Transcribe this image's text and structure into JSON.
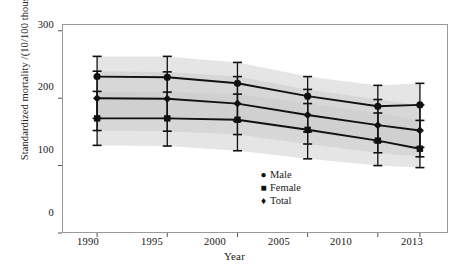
{
  "chart_data": {
    "type": "line",
    "title": "",
    "xlabel": "Year",
    "ylabel": "Standardized mortality /(10/100 thousands)",
    "categories": [
      "1990",
      "1995",
      "2000",
      "2005",
      "2010",
      "2013"
    ],
    "x": [
      1990,
      1995,
      2000,
      2005,
      2010,
      2013
    ],
    "xlim": [
      1987.5,
      2015.0
    ],
    "ylim": [
      0,
      310
    ],
    "yticks": [
      0,
      100,
      200,
      300
    ],
    "xticks": [
      "1990",
      "1995",
      "2000",
      "2005",
      "2010",
      "2013"
    ],
    "grid": false,
    "legend_position": "inside-bottom-center",
    "band_color": "#c9c9c9",
    "band_label": "95% interval band",
    "line_color": "#111111",
    "series": [
      {
        "name": "Male",
        "marker": "circle",
        "values": [
          232,
          231,
          222,
          203,
          188,
          190
        ],
        "err_low": [
          170,
          170,
          166,
          150,
          135,
          127
        ],
        "err_high": [
          262,
          262,
          253,
          232,
          219,
          222
        ]
      },
      {
        "name": "Female",
        "marker": "square",
        "values": [
          170,
          170,
          168,
          153,
          137,
          125
        ],
        "err_low": [
          130,
          129,
          122,
          110,
          100,
          97
        ],
        "err_high": [
          210,
          209,
          206,
          192,
          178,
          167
        ]
      },
      {
        "name": "Total",
        "marker": "diamond",
        "values": [
          200,
          199,
          192,
          175,
          160,
          152
        ],
        "err_low": [
          152,
          151,
          146,
          132,
          119,
          113
        ],
        "err_high": [
          240,
          239,
          232,
          213,
          198,
          190
        ]
      }
    ]
  },
  "axis": {
    "y_ticks": [
      "300",
      "200",
      "100",
      "0"
    ],
    "x_ticks": [
      "1990",
      "1995",
      "2000",
      "2005",
      "2010",
      "2013"
    ],
    "x_title": "Year",
    "y_title": "Standardized mortality /(10/100 thousands)"
  },
  "legend": {
    "items": [
      {
        "label": "Male",
        "marker": "●"
      },
      {
        "label": "Female",
        "marker": "■"
      },
      {
        "label": "Total",
        "marker": "♦"
      }
    ]
  }
}
